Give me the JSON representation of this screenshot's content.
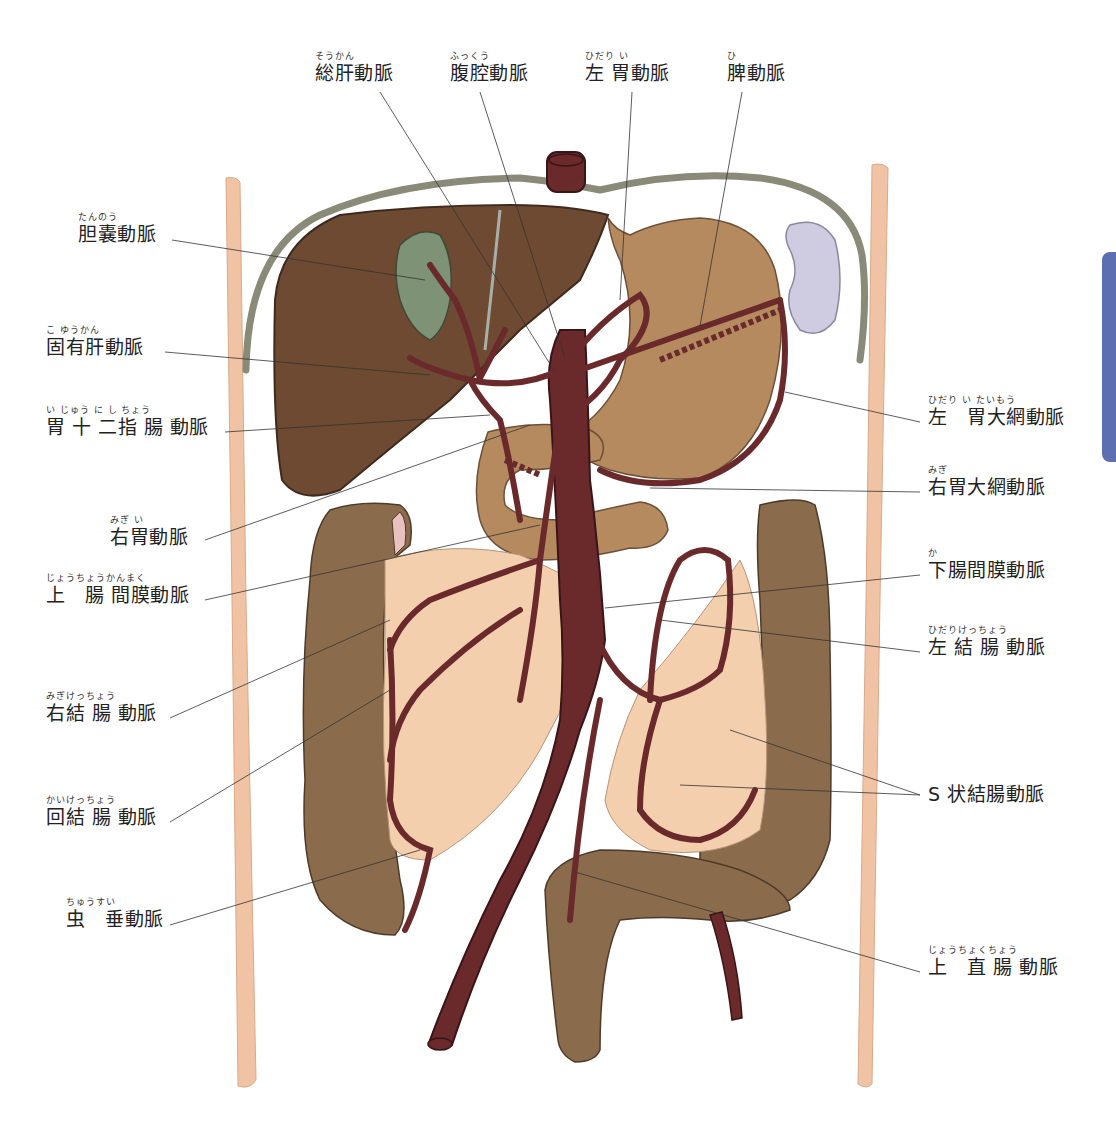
{
  "diagram": {
    "type": "anatomical-illustration",
    "colors": {
      "artery": "#6a2a2c",
      "liver": "#6e4a32",
      "stomach": "#b58a5e",
      "intestine": "#8a6c4c",
      "mesentery": "#f3cfae",
      "gallbladder": "#7e9376",
      "spleen": "#cfcbe0",
      "body_wall": "#f0c3a4",
      "diaphragm": "#8a8a78",
      "side_tab": "#5c6fb0"
    }
  },
  "labels": {
    "top": [
      {
        "id": "common-hepatic-artery",
        "ruby": "そうかん",
        "name": "総肝動脈"
      },
      {
        "id": "celiac-artery",
        "ruby": "ふっくう",
        "name": "腹腔動脈"
      },
      {
        "id": "left-gastric-artery",
        "ruby": "ひだり い",
        "name": "左 胃動脈"
      },
      {
        "id": "splenic-artery",
        "ruby": "ひ",
        "name": "脾動脈"
      }
    ],
    "left": [
      {
        "id": "cystic-artery",
        "ruby": "たんのう",
        "name": "胆嚢動脈"
      },
      {
        "id": "proper-hepatic-artery",
        "ruby": "こ ゆうかん",
        "name": "固有肝動脈"
      },
      {
        "id": "gastroduodenal-artery",
        "ruby": "い じゅう に し ちょう",
        "name": "胃 十 二指 腸 動脈"
      },
      {
        "id": "right-gastric-artery",
        "ruby": "みぎ い",
        "name": "右胃動脈"
      },
      {
        "id": "superior-mesenteric-artery",
        "ruby": "じょうちょうかんまく",
        "name": "上　腸 間膜動脈"
      },
      {
        "id": "right-colic-artery",
        "ruby": "みぎけっちょう",
        "name": "右結 腸 動脈"
      },
      {
        "id": "ileocolic-artery",
        "ruby": "かいけっちょう",
        "name": "回結 腸 動脈"
      },
      {
        "id": "appendicular-artery",
        "ruby": "ちゅうすい",
        "name": "虫　垂動脈"
      }
    ],
    "right": [
      {
        "id": "left-gastroepiploic-artery",
        "ruby": "ひだり い たいもう",
        "name": "左　胃大網動脈"
      },
      {
        "id": "right-gastroepiploic-artery",
        "ruby": "みぎ",
        "name": "右胃大網動脈"
      },
      {
        "id": "inferior-mesenteric-artery",
        "ruby": "か",
        "name": "下腸間膜動脈"
      },
      {
        "id": "left-colic-artery",
        "ruby": "ひだりけっちょう",
        "name": "左 結 腸 動脈"
      },
      {
        "id": "sigmoid-arteries",
        "ruby": "",
        "name": "S 状結腸動脈"
      },
      {
        "id": "superior-rectal-artery",
        "ruby": "じょうちょくちょう",
        "name": "上　直 腸 動脈"
      }
    ]
  }
}
